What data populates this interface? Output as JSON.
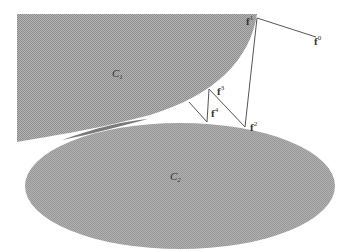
{
  "figure": {
    "colors": {
      "region_fill": "#a9a9a9",
      "overlap_fill": "#8c8c8c",
      "line": "#555555",
      "label": "#333333",
      "background": "#ffffff"
    },
    "regions": [
      {
        "id": "C1",
        "label": "C",
        "subscript": "1"
      },
      {
        "id": "C2",
        "label": "C",
        "subscript": "2"
      }
    ],
    "points": [
      {
        "id": "f0",
        "label": "f",
        "superscript": "0"
      },
      {
        "id": "f1",
        "label": "f",
        "superscript": "1"
      },
      {
        "id": "f2",
        "label": "f",
        "superscript": "2"
      },
      {
        "id": "f3",
        "label": "f",
        "superscript": "3"
      },
      {
        "id": "f4",
        "label": "f",
        "superscript": "4"
      }
    ]
  }
}
